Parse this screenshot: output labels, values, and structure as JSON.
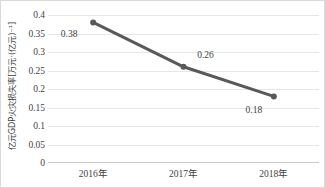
{
  "chart_data": {
    "type": "line",
    "title": "",
    "xlabel": "",
    "ylabel": "亿元GDP火灾损失率[万元·(亿元)⁻¹]",
    "categories": [
      "2016年",
      "2017年",
      "2018年"
    ],
    "values": [
      0.38,
      0.26,
      0.18
    ],
    "point_labels": [
      "0.38",
      "0.26",
      "0.18"
    ],
    "ylim": [
      0,
      0.4
    ],
    "ytick_labels": [
      "0.4",
      "0.35",
      "0.3",
      "0.25",
      "0.2",
      "0.15",
      "0.1",
      "0.05",
      "0"
    ],
    "ytick_values": [
      0.4,
      0.35,
      0.3,
      0.25,
      0.2,
      0.15,
      0.1,
      0.05,
      0
    ],
    "grid": "horizontal",
    "legend": "none",
    "series": [
      {
        "name": "亿元GDP火灾损失率",
        "values": [
          0.38,
          0.26,
          0.18
        ],
        "line_color": "#595959",
        "marker_color": "#595959",
        "marker": "circle"
      }
    ],
    "colors": {
      "line": "#595959",
      "marker": "#595959",
      "gridline": "#e6e6e6",
      "axis": "#c9c9c9",
      "text": "#3f3f3f",
      "border": "#d9d9d9",
      "background": "#ffffff"
    },
    "label_offsets": [
      {
        "dx": -24,
        "dy": 12
      },
      {
        "dx": 22,
        "dy": -12
      },
      {
        "dx": -20,
        "dy": 14
      }
    ]
  }
}
